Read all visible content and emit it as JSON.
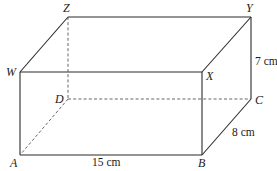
{
  "diagram": {
    "type": "cuboid",
    "vertices": {
      "A": {
        "label": "A",
        "x": 20,
        "y": 155
      },
      "B": {
        "label": "B",
        "x": 202,
        "y": 155
      },
      "C": {
        "label": "C",
        "x": 251,
        "y": 99
      },
      "D": {
        "label": "D",
        "x": 68,
        "y": 99
      },
      "W": {
        "label": "W",
        "x": 20,
        "y": 72
      },
      "X": {
        "label": "X",
        "x": 202,
        "y": 72
      },
      "Y": {
        "label": "Y",
        "x": 251,
        "y": 17
      },
      "Z": {
        "label": "Z",
        "x": 68,
        "y": 17
      }
    },
    "dimensions": {
      "length": "15 cm",
      "width": "8 cm",
      "height": "7 cm"
    },
    "colors": {
      "edge": "#2a2a2a",
      "hidden_edge": "#555555",
      "background": "#ffffff"
    }
  }
}
